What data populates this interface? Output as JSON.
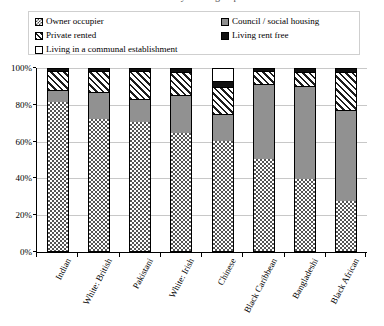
{
  "title_sliver": "Tenure by ethnic group",
  "legend": {
    "left_items": [
      {
        "label": "Owner occupier",
        "icon": "owner-occupier-swatch",
        "pattern": "checker",
        "color": "#4a4a4a"
      },
      {
        "label": "Private rented",
        "icon": "private-rented-swatch",
        "pattern": "diagonal-stripes",
        "color": "#1d1d1d"
      },
      {
        "label": "Living in a communal establishment",
        "icon": "communal-establishment-swatch",
        "pattern": "solid-white",
        "color": "#ffffff"
      }
    ],
    "right_items": [
      {
        "label": "Council / social housing",
        "icon": "council-social-housing-swatch",
        "pattern": "solid-grey",
        "color": "#8e8e8e"
      },
      {
        "label": "Living rent free",
        "icon": "living-rent-free-swatch",
        "pattern": "solid-black",
        "color": "#111111"
      }
    ]
  },
  "yticks": [
    "100%",
    "80%",
    "60%",
    "40%",
    "20%",
    "0%"
  ],
  "chart_data": {
    "type": "bar",
    "stacked": true,
    "stack_mode": "percent",
    "title": "Tenure by ethnic group",
    "xlabel": "",
    "ylabel": "",
    "ylim": [
      0,
      100
    ],
    "yticks": [
      0,
      20,
      40,
      60,
      80,
      100
    ],
    "grid": true,
    "legend_position": "top",
    "categories": [
      "Indian",
      "White: British",
      "Pakistani",
      "White: Irish",
      "Chinese",
      "Black Caribbean",
      "Bangladeshi",
      "Black African"
    ],
    "series": [
      {
        "name": "Owner occupier",
        "pattern": "checker",
        "values": [
          81,
          72,
          70,
          64,
          60,
          50,
          39,
          27
        ]
      },
      {
        "name": "Council / social housing",
        "pattern": "solid-grey",
        "values": [
          6,
          14,
          12,
          20,
          14,
          40,
          50,
          49
        ]
      },
      {
        "name": "Private rented",
        "pattern": "diagonal-stripes",
        "values": [
          10,
          11,
          15,
          12,
          14,
          7,
          7,
          20
        ]
      },
      {
        "name": "Living rent free",
        "pattern": "solid-black",
        "values": [
          2,
          2,
          3,
          2,
          3,
          3,
          4,
          3
        ]
      },
      {
        "name": "Living in a communal establishment",
        "pattern": "solid-white",
        "values": [
          1,
          1,
          0,
          2,
          9,
          0,
          0,
          1
        ]
      }
    ]
  }
}
